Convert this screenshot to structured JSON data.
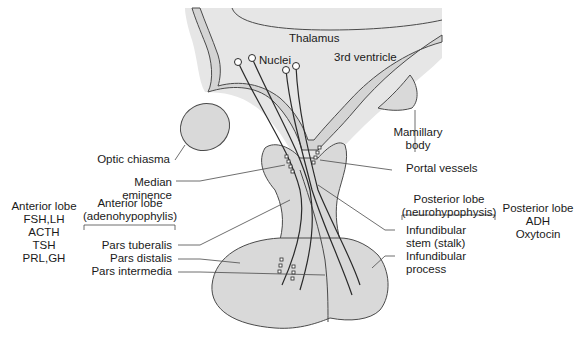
{
  "colors": {
    "tissue_fill": "#d9d9d9",
    "tissue_light": "#e8e8e8",
    "outline": "#4a4a4a",
    "text": "#1a1a1a",
    "background": "#ffffff"
  },
  "labels": {
    "thalamus": "Thalamus",
    "nuclei": "Nuclei",
    "third_ventricle": "3rd ventricle",
    "mamillary_body_line1": "Mamillary",
    "mamillary_body_line2": "body",
    "optic_chiasma": "Optic chiasma",
    "portal_vessels": "Portal vessels",
    "median_eminence_line1": "Median",
    "median_eminence_line2": "eminence",
    "anterior_lobe_group_line1": "Anterior lobe",
    "anterior_lobe_group_line2": "(adenohypophylis)",
    "pars_tuberalis": "Pars tuberalis",
    "pars_distalis": "Pars distalis",
    "pars_intermedia": "Pars intermedia",
    "posterior_lobe_group_line1": "Posterior lobe",
    "posterior_lobe_group_line2": "(neurohypophysis)",
    "infundibular_stem_line1": "Infundibular",
    "infundibular_stem_line2": "stem (stalk)",
    "infundibular_process_line1": "Infundibular",
    "infundibular_process_line2": "process"
  },
  "hormones": {
    "anterior": {
      "title": "Anterior lobe",
      "items": [
        "FSH,LH",
        "ACTH",
        "TSH",
        "PRL,GH"
      ]
    },
    "posterior": {
      "title": "Posterior lobe",
      "items": [
        "ADH",
        "Oxytocin"
      ]
    }
  }
}
